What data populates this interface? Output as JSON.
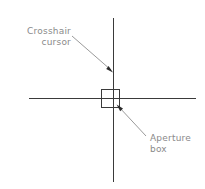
{
  "diagram": {
    "background_color": "#ffffff",
    "line_color": "#3a3a3a",
    "label_color": "#8a8a8a",
    "annotations": [
      {
        "id": "crosshair",
        "name": "crosshair-cursor",
        "line1": "Crosshair",
        "line2": "cursor",
        "leader_from": [
          72,
          36
        ],
        "leader_to": [
          113,
          72
        ]
      },
      {
        "id": "aperture",
        "name": "aperture-box",
        "line1": "Aperture",
        "line2": "box",
        "leader_from": [
          146,
          136
        ],
        "leader_to": [
          117,
          105
        ]
      }
    ],
    "crosshair": {
      "horizontal": {
        "x1": 29,
        "y1": 98,
        "x2": 196,
        "y2": 98
      },
      "vertical": {
        "x1": 113,
        "y1": 18,
        "x2": 113,
        "y2": 182
      }
    },
    "aperture_box": {
      "x": 101,
      "y": 89,
      "width": 18,
      "height": 18
    }
  }
}
